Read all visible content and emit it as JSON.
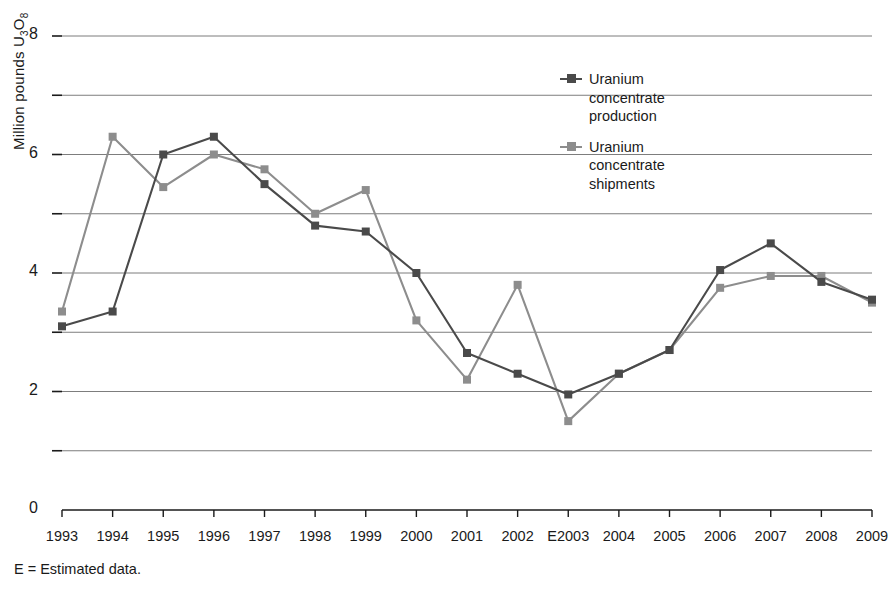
{
  "chart_data": {
    "type": "line",
    "title": "",
    "xlabel": "",
    "ylabel": "Million pounds U3O8",
    "ylabel_prefix": "Million pounds U",
    "ylabel_sub1": "3",
    "ylabel_mid": "O",
    "ylabel_sub2": "8",
    "categories": [
      "1993",
      "1994",
      "1995",
      "1996",
      "1997",
      "1998",
      "1999",
      "2000",
      "2001",
      "2002",
      "E2003",
      "2004",
      "2005",
      "2006",
      "2007",
      "2008",
      "2009"
    ],
    "ylim": [
      0,
      8
    ],
    "yticks": [
      0,
      2,
      4,
      6,
      8
    ],
    "ytick_labels": [
      "0",
      "2",
      "4",
      "6",
      "8"
    ],
    "gridlines": [
      1,
      2,
      3,
      4,
      5,
      6,
      7,
      8
    ],
    "grid": true,
    "legend_position": "inside-top-right",
    "series": [
      {
        "name": "Uranium concentrate production",
        "label_lines": "Uranium\nconcentrate\nproduction",
        "color": "#4a4a4a",
        "values": [
          3.1,
          3.35,
          6.0,
          6.3,
          5.5,
          4.8,
          4.7,
          4.0,
          2.65,
          2.3,
          1.95,
          2.3,
          2.7,
          4.05,
          4.5,
          3.85,
          3.55
        ]
      },
      {
        "name": "Uranium concentrate shipments",
        "label_lines": "Uranium\nconcentrate\nshipments",
        "color": "#8d8d8d",
        "values": [
          3.35,
          6.3,
          5.45,
          6.0,
          5.75,
          5.0,
          5.4,
          3.2,
          2.2,
          3.8,
          1.5,
          2.3,
          2.7,
          3.75,
          3.95,
          3.95,
          3.5
        ]
      }
    ],
    "footnote": "E = Estimated data."
  }
}
